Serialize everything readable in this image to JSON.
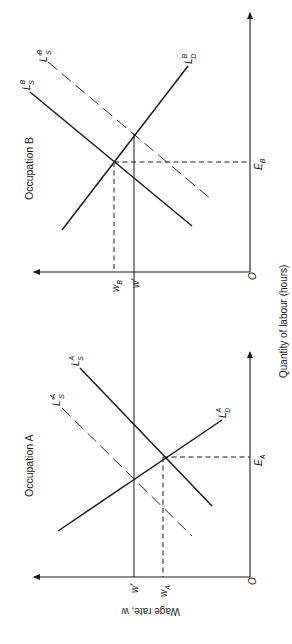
{
  "orientation": "rotated 90 degrees clockwise (diagram printed sideways)",
  "axes": {
    "y_label": "Wage rate, w",
    "x_label": "Quantity of labour (hours)",
    "origin_label": "O"
  },
  "panels": [
    {
      "id": "occupation-a",
      "title": "Occupation A",
      "curves": {
        "supply": {
          "main": "L",
          "sup": "A",
          "sub": "S"
        },
        "supply_shifted": {
          "main": "L'",
          "sup": "A",
          "sub": "S"
        },
        "demand": {
          "main": "L",
          "sup": "A",
          "sub": "D"
        }
      },
      "wage_labels": {
        "equilibrium": {
          "main": "w",
          "sub": "A"
        },
        "common": {
          "main": "w'"
        }
      },
      "quantity_label": {
        "main": "E",
        "sub": "A"
      }
    },
    {
      "id": "occupation-b",
      "title": "Occupation B",
      "curves": {
        "supply": {
          "main": "L",
          "sup": "B",
          "sub": "S"
        },
        "supply_shifted": {
          "main": "L'",
          "sup": "B",
          "sub": "S"
        },
        "demand": {
          "main": "L",
          "sup": "B",
          "sub": "D"
        }
      },
      "wage_labels": {
        "equilibrium": {
          "main": "w",
          "sub": "B"
        },
        "common": {
          "main": "w'"
        }
      },
      "quantity_label": {
        "main": "E",
        "sub": "B"
      }
    }
  ]
}
